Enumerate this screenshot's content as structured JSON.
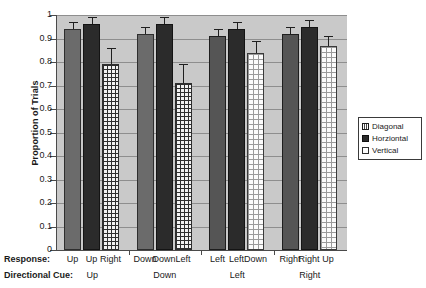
{
  "chart_data": {
    "type": "bar",
    "title": "",
    "xlabel": "",
    "ylabel": "Proportion of Trials",
    "ylim": [
      0,
      1
    ],
    "ytick_labels": [
      "1",
      "0.9",
      "0.8",
      "0.7",
      "0.6",
      "0.5",
      "0.4",
      "0.3",
      "0.2",
      "0.1",
      "0"
    ],
    "ytick_values": [
      1,
      0.9,
      0.8,
      0.7,
      0.6,
      0.5,
      0.4,
      0.3,
      0.2,
      0.1,
      0
    ],
    "grid": true,
    "legend_position": "right",
    "series": [
      {
        "name": "Diagonal",
        "values": [
          0.94,
          0.92,
          0.91,
          0.92
        ],
        "errors": [
          0.03,
          0.03,
          0.03,
          0.03
        ]
      },
      {
        "name": "Horziontal",
        "values": [
          0.96,
          0.96,
          0.94,
          0.95
        ],
        "errors": [
          0.03,
          0.03,
          0.03,
          0.03
        ]
      },
      {
        "name": "Vertical",
        "values": [
          0.79,
          0.71,
          0.84,
          0.87
        ],
        "errors": [
          0.07,
          0.08,
          0.05,
          0.04
        ]
      }
    ],
    "groups": [
      {
        "cue": "Up",
        "responses": [
          "Up",
          "Up",
          "Right"
        ]
      },
      {
        "cue": "Down",
        "responses": [
          "Down",
          "Down",
          "Left"
        ]
      },
      {
        "cue": "Left",
        "responses": [
          "Left",
          "Left",
          "Down"
        ]
      },
      {
        "cue": "Right",
        "responses": [
          "Right",
          "Right",
          "Up"
        ]
      }
    ]
  },
  "axis_rows": {
    "response_label": "Response:",
    "cue_label": "Directional Cue:"
  },
  "legend": {
    "items": [
      {
        "label": "Diagonal",
        "swatch": "diagonal-swatch-icon"
      },
      {
        "label": "Horziontal",
        "swatch": "horizontal-swatch-icon"
      },
      {
        "label": "Vertical",
        "swatch": "vertical-swatch-icon"
      }
    ]
  },
  "colors": {
    "plot_background": "#c9c9c9",
    "gridline": "#8e8e8e",
    "axis": "#4a4a4a",
    "diagonal_fill": "#6b6b6b",
    "horizontal_fill": "#2b2b2b",
    "vertical_fill": "#f2f2f2",
    "text": "#1a1a1a"
  }
}
